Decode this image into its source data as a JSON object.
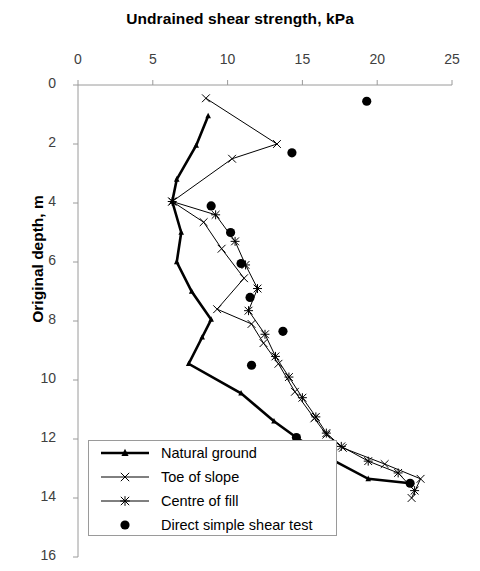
{
  "chart_data": {
    "type": "line",
    "title": "Undrained shear strength, kPa",
    "xlabel": "Undrained shear strength, kPa",
    "ylabel": "Original depth, m",
    "xlim": [
      0,
      25
    ],
    "ylim": [
      0,
      16
    ],
    "y_inverted": true,
    "xticks": [
      0,
      5,
      10,
      15,
      20,
      25
    ],
    "yticks": [
      0,
      2,
      4,
      6,
      8,
      10,
      12,
      14,
      16
    ],
    "grid": false,
    "legend_position": "bottom-left",
    "series": [
      {
        "name": "Natural ground",
        "marker": "triangle",
        "style": "thick-line",
        "points": [
          [
            8.7,
            1.05
          ],
          [
            7.9,
            2.05
          ],
          [
            6.6,
            3.2
          ],
          [
            6.3,
            3.95
          ],
          [
            6.9,
            5.0
          ],
          [
            6.6,
            6.0
          ],
          [
            7.6,
            7.0
          ],
          [
            8.9,
            7.95
          ],
          [
            8.3,
            8.55
          ],
          [
            7.4,
            9.45
          ],
          [
            10.9,
            10.45
          ],
          [
            13.1,
            11.4
          ],
          [
            14.6,
            11.95
          ],
          [
            16.6,
            12.6
          ],
          [
            19.4,
            13.35
          ],
          [
            22.2,
            13.5
          ]
        ]
      },
      {
        "name": "Toe of slope",
        "marker": "x",
        "style": "thin-line",
        "points": [
          [
            8.55,
            0.45
          ],
          [
            13.3,
            2.0
          ],
          [
            10.3,
            2.5
          ],
          [
            6.3,
            3.95
          ],
          [
            8.4,
            4.65
          ],
          [
            9.6,
            5.55
          ],
          [
            11.1,
            6.55
          ],
          [
            9.3,
            7.6
          ],
          [
            11.6,
            8.1
          ],
          [
            12.4,
            8.75
          ],
          [
            13.4,
            9.45
          ],
          [
            14.5,
            10.4
          ],
          [
            15.8,
            11.3
          ],
          [
            16.6,
            11.85
          ],
          [
            17.7,
            12.3
          ],
          [
            20.5,
            12.85
          ],
          [
            22.9,
            13.35
          ],
          [
            22.3,
            14.0
          ]
        ]
      },
      {
        "name": "Centre of fill",
        "marker": "asterisk",
        "style": "thin-line",
        "points": [
          [
            6.3,
            3.95
          ],
          [
            9.2,
            4.4
          ],
          [
            10.5,
            5.3
          ],
          [
            11.2,
            6.1
          ],
          [
            12.0,
            6.9
          ],
          [
            11.4,
            7.65
          ],
          [
            12.5,
            8.45
          ],
          [
            13.2,
            9.2
          ],
          [
            14.1,
            9.9
          ],
          [
            15.0,
            10.6
          ],
          [
            15.9,
            11.25
          ],
          [
            16.6,
            11.8
          ],
          [
            17.6,
            12.25
          ],
          [
            19.4,
            12.75
          ],
          [
            21.4,
            13.15
          ],
          [
            22.5,
            13.75
          ]
        ]
      },
      {
        "name": "Direct simple shear test",
        "marker": "circle",
        "style": "points-only",
        "points": [
          [
            19.3,
            0.55
          ],
          [
            14.3,
            2.3
          ],
          [
            8.9,
            4.1
          ],
          [
            10.2,
            5.0
          ],
          [
            10.9,
            6.05
          ],
          [
            11.5,
            7.2
          ],
          [
            13.7,
            8.35
          ],
          [
            11.6,
            9.5
          ],
          [
            14.6,
            11.95
          ],
          [
            16.6,
            12.6
          ],
          [
            22.2,
            13.5
          ]
        ]
      }
    ]
  },
  "legend": {
    "items": [
      {
        "label": "Natural ground",
        "marker": "triangle"
      },
      {
        "label": "Toe of slope",
        "marker": "x"
      },
      {
        "label": "Centre of fill",
        "marker": "asterisk"
      },
      {
        "label": "Direct simple shear test",
        "marker": "circle"
      }
    ]
  },
  "colors": {
    "line": "#000000",
    "axis": "#9a9a9a",
    "tick_label": "#404040",
    "background": "#ffffff"
  }
}
